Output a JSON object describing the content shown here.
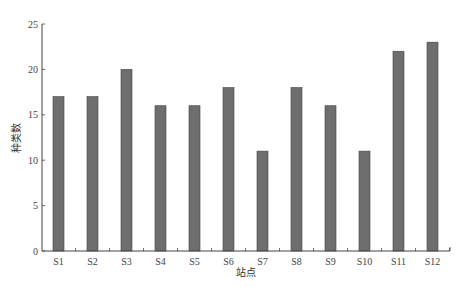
{
  "chart_data": {
    "type": "bar",
    "title": "",
    "xlabel": "站点",
    "ylabel": "种类数",
    "categories": [
      "S1",
      "S2",
      "S3",
      "S4",
      "S5",
      "S6",
      "S7",
      "S8",
      "S9",
      "S10",
      "S11",
      "S12"
    ],
    "values": [
      17,
      17,
      20,
      16,
      16,
      18,
      11,
      18,
      16,
      11,
      22,
      23
    ],
    "ylim": [
      0,
      25
    ],
    "yticks": [
      0,
      5,
      10,
      15,
      20,
      25
    ],
    "grid": false,
    "legend": null,
    "bar_color": "#6e6e6e",
    "bar_edge_color": "#444444"
  }
}
